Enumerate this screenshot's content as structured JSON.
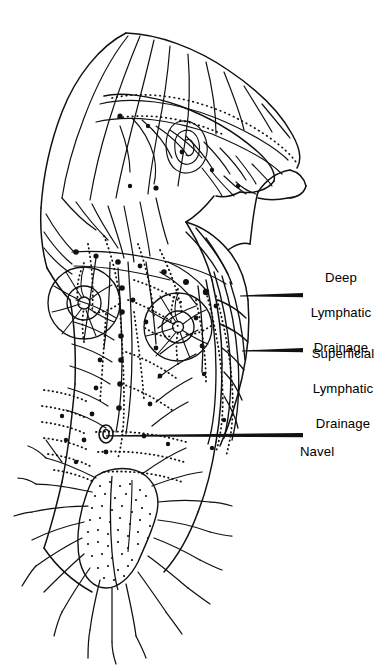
{
  "figure": {
    "style": "black-and-white anatomical line drawing",
    "background_color": "#ffffff",
    "ink_color": "#000000",
    "view": "anterior torso, head flexed forward, right arm raised",
    "regions": [
      "scalp and head lymphatics",
      "cervical chain",
      "axillary nodes",
      "breast / mammary plexus",
      "intercostal and thoracic vessels",
      "abdominal wall plexus",
      "navel (umbilicus)",
      "inguinal nodes and pelvic plexus",
      "upper limb superficial and deep vessels"
    ],
    "line_types": [
      {
        "name": "solid-vessel",
        "meaning": "deep lymphatic vessel"
      },
      {
        "name": "dotted-vessel",
        "meaning": "superficial lymphatic vessel"
      },
      {
        "name": "filled-node",
        "meaning": "lymph node"
      },
      {
        "name": "stipple-mass",
        "meaning": "dense nodal cluster"
      }
    ]
  },
  "labels": [
    {
      "id": "deep",
      "lines": [
        "Deep",
        "Lymphatic",
        "Drainage"
      ],
      "text": "Deep Lymphatic Drainage",
      "align": "center",
      "leader": {
        "x1": 240,
        "y1": 295,
        "x2": 303,
        "y2": 295
      }
    },
    {
      "id": "superficial",
      "lines": [
        "Superficial",
        "Lymphatic",
        "Drainage"
      ],
      "text": "Superficial Lymphatic Drainage",
      "align": "center",
      "leader": {
        "x1": 242,
        "y1": 350,
        "x2": 303,
        "y2": 350
      }
    },
    {
      "id": "navel",
      "lines": [
        "Navel"
      ],
      "text": "Navel",
      "align": "left",
      "leader": {
        "x1": 106,
        "y1": 435,
        "x2": 303,
        "y2": 435
      }
    }
  ]
}
